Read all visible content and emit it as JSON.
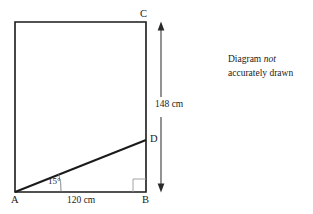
{
  "diagram": {
    "type": "geometry-figure",
    "shape": "rectangle-with-diagonal",
    "vertices": {
      "C": "C",
      "D": "D",
      "A": "A",
      "B": "B"
    },
    "dimensions": {
      "vertical_BC": "148 cm",
      "horizontal_AB": "120 cm"
    },
    "angle": {
      "at_vertex": "A",
      "value": "15°"
    },
    "markers": {
      "right_angle_at": "B"
    },
    "note": {
      "line1_prefix": "Diagram ",
      "line1_emphasis": "not",
      "line2": "accurately drawn"
    },
    "colors": {
      "stroke": "#1a1a1a",
      "right_angle_marker": "#9a9a9a",
      "arrow": "#3a3a3a",
      "background": "#ffffff"
    }
  }
}
